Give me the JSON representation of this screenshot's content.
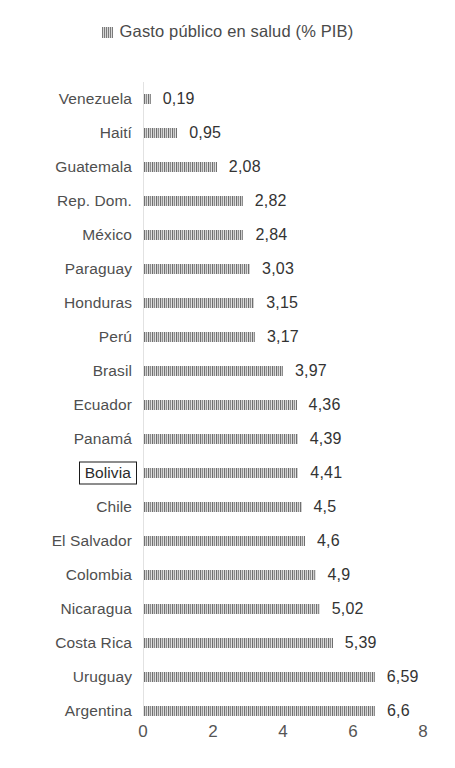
{
  "legend": {
    "marker_icon": "striped-square-icon",
    "label": "Gasto público en salud (% PIB)"
  },
  "axis": {
    "ticks": [
      "0",
      "2",
      "4",
      "6",
      "8"
    ]
  },
  "highlight": {
    "category": "Bolivia"
  },
  "colors": {
    "bar_fill": "#a7a7a7",
    "bar_hatch": "#6f6f6f",
    "axis_line": "#e2e2e2",
    "text": "#4f4f4f",
    "highlight_border": "#1a1a1a",
    "background": "#ffffff"
  },
  "chart_data": {
    "type": "bar",
    "orientation": "horizontal",
    "title": "Gasto público en salud (% PIB)",
    "xlabel": "",
    "ylabel": "",
    "xlim": [
      0,
      8
    ],
    "xticks": [
      0,
      2,
      4,
      6,
      8
    ],
    "grid": false,
    "legend_position": "top-center",
    "series_name": "Gasto público en salud (% PIB)",
    "categories": [
      "Venezuela",
      "Haití",
      "Guatemala",
      "Rep. Dom.",
      "México",
      "Paraguay",
      "Honduras",
      "Perú",
      "Brasil",
      "Ecuador",
      "Panamá",
      "Bolivia",
      "Chile",
      "El Salvador",
      "Colombia",
      "Nicaragua",
      "Costa Rica",
      "Uruguay",
      "Argentina"
    ],
    "values": [
      0.19,
      0.95,
      2.08,
      2.82,
      2.84,
      3.03,
      3.15,
      3.17,
      3.97,
      4.36,
      4.39,
      4.41,
      4.5,
      4.6,
      4.9,
      5.02,
      5.39,
      6.59,
      6.6
    ],
    "value_labels": [
      "0,19",
      "0,95",
      "2,08",
      "2,82",
      "2,84",
      "3,03",
      "3,15",
      "3,17",
      "3,97",
      "4,36",
      "4,39",
      "4,41",
      "4,5",
      "4,6",
      "4,9",
      "5,02",
      "5,39",
      "6,59",
      "6,6"
    ]
  }
}
